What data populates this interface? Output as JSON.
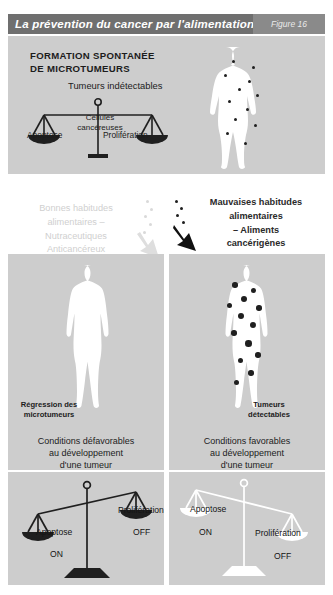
{
  "header": {
    "title": "La prévention du cancer par l'alimentation",
    "figure_label": "Figure 16",
    "bar_color": "#6f6f6f",
    "tag_color": "#8a8a8a"
  },
  "panels": {
    "top": {
      "heading_line1": "FORMATION SPONTANÉE",
      "heading_line2": "DE MICROTUMEURS",
      "subtitle": "Tumeurs indétectables",
      "balance": {
        "center_label_line1": "Cellules",
        "center_label_line2": "cancéreuses",
        "left_label": "Apoptose",
        "right_label": "Prolifération",
        "tilt": "balanced"
      },
      "body_dot_count": 12
    },
    "middle": {
      "left_text_line1": "Bonnes habitudes",
      "left_text_line2": "alimentaires –",
      "left_text_line3": "Nutraceutiques",
      "left_text_line4": "Anticancéreux",
      "left_arrow": "down-arrow-icon-light",
      "left_text_color": "#cfcfcf",
      "right_text_line1": "Mauvaises habitudes",
      "right_text_line2": "alimentaires",
      "right_text_line3": "– Aliments",
      "right_text_line4": "cancérigènes",
      "right_arrow": "down-arrow-icon-dark",
      "right_text_color": "#2a2a2a"
    },
    "bottom_left": {
      "caption_line1": "Régression des",
      "caption_line2": "microtumeurs",
      "conditions_line1": "Conditions défavorables",
      "conditions_line2": "au développement",
      "conditions_line3": "d'une tumeur",
      "body_dot_count": 0
    },
    "bottom_right": {
      "caption_line1": "Tumeurs",
      "caption_line2": "détectables",
      "conditions_line1": "Conditions favorables",
      "conditions_line2": "au développement",
      "conditions_line3": "d'une tumeur",
      "body_dot_count": 13
    },
    "scale_left": {
      "left_label": "Apoptose",
      "left_state": "ON",
      "right_label": "Prolifération",
      "right_state": "OFF",
      "tilt": "left-down"
    },
    "scale_right": {
      "left_label": "Apoptose",
      "left_state": "ON",
      "right_label": "Prolifération",
      "right_state": "OFF",
      "tilt": "right-down"
    }
  },
  "colors": {
    "panel_gray": "#cdcdcd",
    "silhouette": "#ffffff",
    "dot": "#1f1f1f",
    "text": "#1c1c1c"
  }
}
